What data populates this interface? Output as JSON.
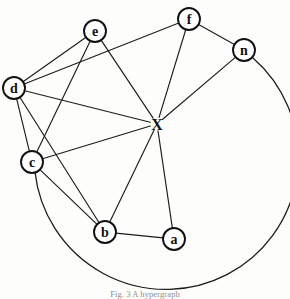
{
  "figure": {
    "caption": "Fig. 3 A hypergraph",
    "background_color": "#fdfdfb",
    "ink_color": "#1c1c1c"
  },
  "graph_data": {
    "type": "node-link-diagram",
    "nodes": [
      {
        "id": "e",
        "label": "e",
        "cx": 95,
        "cy": 31,
        "r": 11,
        "boxed": true
      },
      {
        "id": "f",
        "label": "f",
        "cx": 189,
        "cy": 19,
        "r": 11,
        "boxed": true
      },
      {
        "id": "n",
        "label": "n",
        "cx": 244,
        "cy": 50,
        "r": 11,
        "boxed": true
      },
      {
        "id": "d",
        "label": "d",
        "cx": 14,
        "cy": 88,
        "r": 11,
        "boxed": true
      },
      {
        "id": "x",
        "label": "X",
        "cx": 157,
        "cy": 124,
        "r": 0,
        "boxed": false
      },
      {
        "id": "c",
        "label": "c",
        "cx": 32,
        "cy": 162,
        "r": 11,
        "boxed": true
      },
      {
        "id": "b",
        "label": "b",
        "cx": 105,
        "cy": 232,
        "r": 11,
        "boxed": true
      },
      {
        "id": "a",
        "label": "a",
        "cx": 174,
        "cy": 239,
        "r": 11,
        "boxed": true
      }
    ],
    "edges": [
      {
        "from": "d",
        "to": "e"
      },
      {
        "from": "d",
        "to": "f"
      },
      {
        "from": "d",
        "to": "x"
      },
      {
        "from": "d",
        "to": "c"
      },
      {
        "from": "d",
        "to": "b"
      },
      {
        "from": "e",
        "to": "c"
      },
      {
        "from": "e",
        "to": "x"
      },
      {
        "from": "c",
        "to": "x"
      },
      {
        "from": "c",
        "to": "b"
      },
      {
        "from": "b",
        "to": "x"
      },
      {
        "from": "b",
        "to": "a"
      },
      {
        "from": "a",
        "to": "x"
      },
      {
        "from": "f",
        "to": "x"
      },
      {
        "from": "f",
        "to": "n"
      },
      {
        "from": "n",
        "to": "x"
      }
    ],
    "arc": {
      "from": "c",
      "to": "n",
      "description": "large circular arc sweeping below b and a from node c around to node n"
    },
    "node_count": 8,
    "edge_count": 15
  }
}
